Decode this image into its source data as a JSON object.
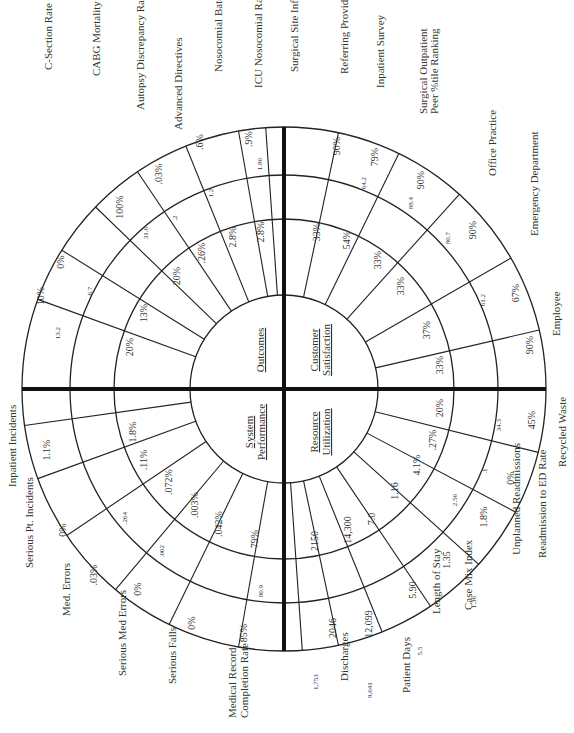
{
  "chart_data": {
    "type": "radar-wheel",
    "orientation": "rotated 90° clockwise (labels read bottom-to-top)",
    "center": [
      284,
      389
    ],
    "rings": {
      "hub": 94,
      "inner": 170,
      "middle": 214,
      "outer": 262
    },
    "quadrants": [
      {
        "name": "Outcomes",
        "lines": [
          "Outcomes"
        ],
        "metrics": [
          {
            "label": "C-Section Rate",
            "inner_value": "20%",
            "prior": "13.2",
            "outer_value": "10%",
            "angle": 200
          },
          {
            "label": "CABG Mortality",
            "inner_value": "13%",
            "prior": "6.7",
            "outer_value": "0%",
            "angle": 212
          },
          {
            "label": "Autopsy Discrepancy Rate",
            "inner_value": "20%",
            "prior": "31.6",
            "outer_value": "100%",
            "angle": 224
          },
          {
            "label": "Advanced Directives",
            "inner_value": ".26%",
            "prior": ".2",
            "outer_value": ".03%",
            "angle": 236
          },
          {
            "label": "Nosocomial Baterenias",
            "inner_value": "2.8%",
            "prior": "1.2",
            "outer_value": ".6%",
            "angle": 248
          },
          {
            "label": "ICU Nosocomial Rate",
            "inner_value": "2.8%",
            "prior": "1.86",
            "outer_value": ".9%",
            "angle": 260
          },
          {
            "label": "Surgical Site Infection Rate",
            "inner_value": "",
            "prior": "",
            "outer_value": "",
            "angle": 266
          }
        ]
      },
      {
        "name": "Customer Satisfaction",
        "lines": [
          "Customer",
          "Satisfaction"
        ],
        "metrics": [
          {
            "label": "Referring Provider Survey",
            "inner_value": "33%",
            "prior": "",
            "outer_value": "90%",
            "angle": 282
          },
          {
            "label": "Inpatient Survey",
            "inner_value": "54%",
            "prior": "64.2",
            "outer_value": "79%",
            "angle": 296
          },
          {
            "label": "Surgical Outpatient Peer %tile Ranking",
            "inner_value": "33%",
            "prior": "88.4",
            "outer_value": "90%",
            "angle": 312
          },
          {
            "label": "Office Practice",
            "inner_value": "33%",
            "prior": "80.7",
            "outer_value": "90%",
            "angle": 330
          },
          {
            "label": "Emergency Department",
            "inner_value": "37%",
            "prior": "61.2",
            "outer_value": "67%",
            "angle": 347
          },
          {
            "label": "Employee",
            "inner_value": "33%",
            "prior": "",
            "outer_value": "90%",
            "angle": 360
          }
        ]
      },
      {
        "name": "Resource Utilization",
        "lines": [
          "Resource",
          "Utilization"
        ],
        "metrics": [
          {
            "label": "Recycled Waste",
            "inner_value": "20%",
            "prior": "34.3",
            "outer_value": "45%",
            "angle": 14
          },
          {
            "label": "Readmission to ED Rate",
            "inner_value": ".27%",
            "prior": ".1",
            "outer_value": "0%",
            "angle": 28
          },
          {
            "label": "Unplanned Readmissions",
            "inner_value": "4.1%",
            "prior": "2.56",
            "outer_value": "1.8%",
            "angle": 42
          },
          {
            "label": "Case Mix Index",
            "inner_value": "1.16",
            "prior": "1.36",
            "outer_value": "1.35",
            "angle": 56
          },
          {
            "label": "Length of Stay",
            "inner_value": "7.0",
            "prior": "5.5",
            "outer_value": "5.90",
            "angle": 68
          },
          {
            "label": "Patient Days",
            "inner_value": "14,300",
            "prior": "9,641",
            "outer_value": "12,099",
            "angle": 78
          },
          {
            "label": "Discharges",
            "inner_value": "2150",
            "prior": "1,753",
            "outer_value": "2046",
            "angle": 86
          }
        ]
      },
      {
        "name": "System Performance",
        "lines": [
          "System",
          "Performance"
        ],
        "metrics": [
          {
            "label": "Medical Record Completion Rate",
            "inner_value": "79%",
            "prior": "80.9",
            "outer_value": "85%",
            "angle": 100
          },
          {
            "label": "Serious Falls",
            "inner_value": ".042%",
            "prior": "",
            "outer_value": "0%",
            "angle": 116
          },
          {
            "label": "Serious Med Errors",
            "inner_value": ".003%",
            "prior": ".002",
            "outer_value": "0%",
            "angle": 130
          },
          {
            "label": "Med. Errors",
            "inner_value": ".072%",
            "prior": ".264",
            "outer_value": ".03%",
            "angle": 146
          },
          {
            "label": "Serious Pt. Incidents",
            "inner_value": ".11%",
            "prior": "",
            "outer_value": "0%",
            "angle": 160
          },
          {
            "label": "Inpatient Incidents",
            "inner_value": "1.8%",
            "prior": "",
            "outer_value": "1.1%",
            "angle": 172
          }
        ]
      }
    ],
    "outer_labels": [
      {
        "text": "C-Section Rate",
        "x": 52,
        "y": 70
      },
      {
        "text": "CABG Mortality",
        "x": 100,
        "y": 76
      },
      {
        "text": "Autopsy Discrepancy Rate",
        "x": 144,
        "y": 110
      },
      {
        "text": "Advanced Directives",
        "x": 182,
        "y": 130
      },
      {
        "text": "Nosocomial Baterenias",
        "x": 222,
        "y": 72
      },
      {
        "text": "ICU Nosocomial Rate",
        "x": 262,
        "y": 88
      },
      {
        "text": "Surgical Site Infection Rate",
        "x": 298,
        "y": 72
      },
      {
        "text": "Referring Provider Survey",
        "x": 348,
        "y": 74
      },
      {
        "text": "Inpatient Survey",
        "x": 384,
        "y": 88
      },
      {
        "text": "Surgical Outpatient",
        "x": 427,
        "y": 114
      },
      {
        "text": "Peer %tile Ranking",
        "x": 438,
        "y": 114
      },
      {
        "text": "Office Practice",
        "x": 496,
        "y": 176
      },
      {
        "text": "Emergency Department",
        "x": 538,
        "y": 236
      },
      {
        "text": "Employee",
        "x": 560,
        "y": 336
      },
      {
        "text": "Recycled Waste",
        "x": 566,
        "y": 467
      },
      {
        "text": "Readmission to ED Rate",
        "x": 546,
        "y": 558
      },
      {
        "text": "Unplanned Readmissions",
        "x": 520,
        "y": 555
      },
      {
        "text": "Case Mix Index",
        "x": 472,
        "y": 610
      },
      {
        "text": "Length of Stay",
        "x": 440,
        "y": 614
      },
      {
        "text": "Patient Days",
        "x": 410,
        "y": 693
      },
      {
        "text": "Discharges",
        "x": 348,
        "y": 681
      },
      {
        "text": "Medical Record",
        "x": 236,
        "y": 718
      },
      {
        "text": "Completion Rate",
        "x": 248,
        "y": 718
      },
      {
        "text": "Serious Falls",
        "x": 176,
        "y": 684
      },
      {
        "text": "Serious Med Errors",
        "x": 126,
        "y": 676
      },
      {
        "text": "Med. Errors",
        "x": 70,
        "y": 616
      },
      {
        "text": "Serious Pt. Incidents",
        "x": 33,
        "y": 568
      },
      {
        "text": "Inpatient Incidents",
        "x": 16,
        "y": 487
      }
    ]
  },
  "cell_values": [
    {
      "t": "10%",
      "x": 44,
      "y": 296,
      "s": 10
    },
    {
      "t": "13.2",
      "x": 60,
      "y": 333,
      "s": 7
    },
    {
      "t": "0%",
      "x": 64,
      "y": 262,
      "s": 10
    },
    {
      "t": "6.7",
      "x": 92,
      "y": 291,
      "s": 7
    },
    {
      "t": "100%",
      "x": 123,
      "y": 207,
      "s": 10
    },
    {
      "t": "31.6",
      "x": 148,
      "y": 233,
      "s": 7
    },
    {
      "t": ".03%",
      "x": 162,
      "y": 174,
      "s": 10
    },
    {
      "t": ".2",
      "x": 177,
      "y": 218,
      "s": 7
    },
    {
      "t": ".6%",
      "x": 203,
      "y": 142,
      "s": 10
    },
    {
      "t": "1.2",
      "x": 213,
      "y": 193,
      "s": 7
    },
    {
      "t": ".9%",
      "x": 252,
      "y": 139,
      "s": 10
    },
    {
      "t": "1.86",
      "x": 262,
      "y": 164,
      "s": 7
    },
    {
      "t": "20%",
      "x": 133,
      "y": 347,
      "s": 10
    },
    {
      "t": "13%",
      "x": 147,
      "y": 313,
      "s": 10
    },
    {
      "t": "20%",
      "x": 180,
      "y": 276,
      "s": 10
    },
    {
      "t": ".26%",
      "x": 205,
      "y": 253,
      "s": 10
    },
    {
      "t": "2.8%",
      "x": 236,
      "y": 237,
      "s": 10
    },
    {
      "t": "2.8%",
      "x": 264,
      "y": 232,
      "s": 10
    },
    {
      "t": "90%",
      "x": 340,
      "y": 146,
      "s": 10
    },
    {
      "t": "79%",
      "x": 378,
      "y": 157,
      "s": 10
    },
    {
      "t": "64.2",
      "x": 366,
      "y": 183,
      "s": 7
    },
    {
      "t": "90%",
      "x": 424,
      "y": 180,
      "s": 10
    },
    {
      "t": "88.4",
      "x": 413,
      "y": 203,
      "s": 7
    },
    {
      "t": "90%",
      "x": 476,
      "y": 230,
      "s": 10
    },
    {
      "t": "80.7",
      "x": 450,
      "y": 238,
      "s": 7
    },
    {
      "t": "67%",
      "x": 519,
      "y": 293,
      "s": 10
    },
    {
      "t": "61.2",
      "x": 485,
      "y": 300,
      "s": 7
    },
    {
      "t": "90%",
      "x": 533,
      "y": 345,
      "s": 10
    },
    {
      "t": "33%",
      "x": 320,
      "y": 232,
      "s": 10
    },
    {
      "t": "54%",
      "x": 350,
      "y": 240,
      "s": 10
    },
    {
      "t": "33%",
      "x": 381,
      "y": 260,
      "s": 10
    },
    {
      "t": "33%",
      "x": 404,
      "y": 286,
      "s": 10
    },
    {
      "t": "37%",
      "x": 430,
      "y": 330,
      "s": 10
    },
    {
      "t": "33%",
      "x": 443,
      "y": 365,
      "s": 10
    },
    {
      "t": "20%",
      "x": 443,
      "y": 408,
      "s": 10
    },
    {
      "t": "34.3",
      "x": 501,
      "y": 425,
      "s": 7
    },
    {
      "t": "45%",
      "x": 535,
      "y": 420,
      "s": 10
    },
    {
      "t": ".27%",
      "x": 436,
      "y": 440,
      "s": 10
    },
    {
      "t": ".1",
      "x": 487,
      "y": 471,
      "s": 7
    },
    {
      "t": "0%",
      "x": 514,
      "y": 478,
      "s": 10
    },
    {
      "t": "4.1%",
      "x": 420,
      "y": 465,
      "s": 10
    },
    {
      "t": "2.56",
      "x": 457,
      "y": 500,
      "s": 7
    },
    {
      "t": "1.8%",
      "x": 487,
      "y": 517,
      "s": 10
    },
    {
      "t": "1.16",
      "x": 398,
      "y": 491,
      "s": 10
    },
    {
      "t": "1.35",
      "x": 450,
      "y": 560,
      "s": 10
    },
    {
      "t": "1.36",
      "x": 476,
      "y": 602,
      "s": 7
    },
    {
      "t": "7.0",
      "x": 375,
      "y": 519,
      "s": 10
    },
    {
      "t": "5.90",
      "x": 416,
      "y": 590,
      "s": 10
    },
    {
      "t": "5.5",
      "x": 422,
      "y": 651,
      "s": 7
    },
    {
      "t": "14,300",
      "x": 351,
      "y": 530,
      "s": 10
    },
    {
      "t": "12,099",
      "x": 372,
      "y": 624,
      "s": 10
    },
    {
      "t": "9,641",
      "x": 372,
      "y": 690,
      "s": 7
    },
    {
      "t": "2150",
      "x": 318,
      "y": 541,
      "s": 10
    },
    {
      "t": "2046",
      "x": 336,
      "y": 628,
      "s": 10
    },
    {
      "t": "1,753",
      "x": 318,
      "y": 682,
      "s": 7
    },
    {
      "t": "79%",
      "x": 258,
      "y": 539,
      "s": 10
    },
    {
      "t": "80.9",
      "x": 263,
      "y": 591,
      "s": 7
    },
    {
      "t": "85%",
      "x": 247,
      "y": 633,
      "s": 10
    },
    {
      "t": ".042%",
      "x": 222,
      "y": 524,
      "s": 10
    },
    {
      "t": "0%",
      "x": 195,
      "y": 623,
      "s": 10
    },
    {
      "t": ".003%",
      "x": 198,
      "y": 505,
      "s": 10
    },
    {
      "t": ".002",
      "x": 164,
      "y": 551,
      "s": 7
    },
    {
      "t": "0%",
      "x": 141,
      "y": 589,
      "s": 10
    },
    {
      "t": ".072%",
      "x": 172,
      "y": 482,
      "s": 10
    },
    {
      "t": ".264",
      "x": 127,
      "y": 518,
      "s": 7
    },
    {
      "t": ".03%",
      "x": 97,
      "y": 575,
      "s": 10
    },
    {
      "t": ".11%",
      "x": 147,
      "y": 460,
      "s": 10
    },
    {
      "t": "0%",
      "x": 66,
      "y": 530,
      "s": 10
    },
    {
      "t": "1.8%",
      "x": 136,
      "y": 432,
      "s": 10
    },
    {
      "t": "1.1%",
      "x": 50,
      "y": 450,
      "s": 10
    }
  ],
  "quadrant_labels": [
    {
      "lines": [
        "Outcomes"
      ],
      "x": 264,
      "y": 350
    },
    {
      "lines": [
        "Customer",
        "Satisfaction"
      ],
      "x": 318,
      "y": 350
    },
    {
      "lines": [
        "System",
        "Performance"
      ],
      "x": 253,
      "y": 432
    },
    {
      "lines": [
        "Resource",
        "Utilization"
      ],
      "x": 318,
      "y": 432
    }
  ]
}
